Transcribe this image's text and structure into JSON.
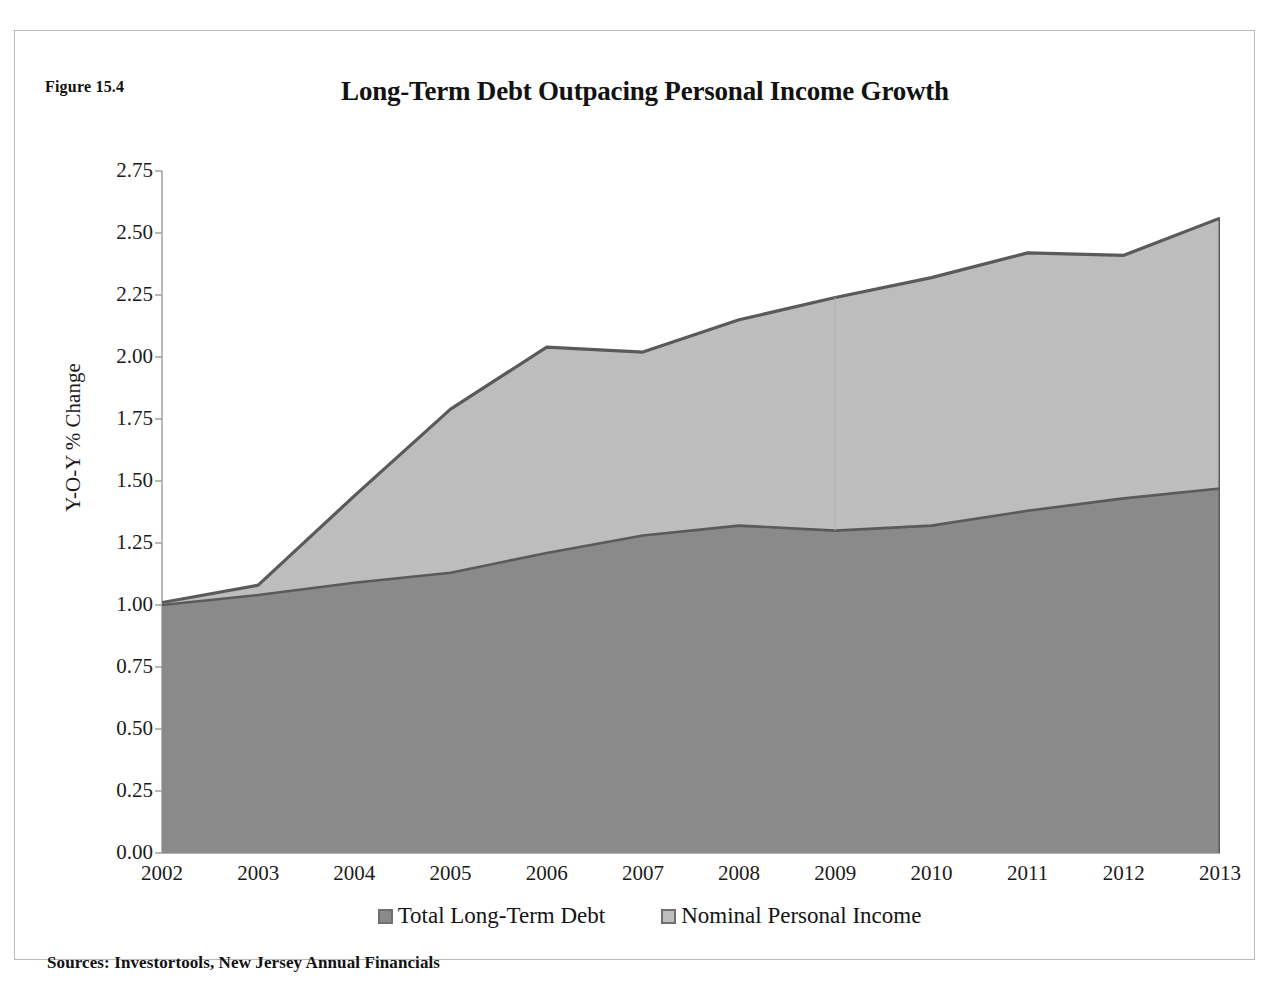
{
  "figure": {
    "number_label": "Figure 15.4",
    "source_note": "Sources: Investortools, New Jersey Annual Financials"
  },
  "chart_data": {
    "type": "area",
    "stacked": true,
    "title": "Long-Term Debt Outpacing Personal Income Growth",
    "xlabel": "",
    "ylabel": "Y-O-Y % Change",
    "categories": [
      "2002",
      "2003",
      "2004",
      "2005",
      "2006",
      "2007",
      "2008",
      "2009",
      "2010",
      "2011",
      "2012",
      "2013"
    ],
    "x": [
      2002,
      2003,
      2004,
      2005,
      2006,
      2007,
      2008,
      2009,
      2010,
      2011,
      2012,
      2013
    ],
    "series": [
      {
        "name": "Total Long-Term Debt",
        "color": "#8a8a8a",
        "values": [
          1.0,
          1.04,
          1.09,
          1.13,
          1.21,
          1.28,
          1.32,
          1.3,
          1.32,
          1.38,
          1.43,
          1.47
        ]
      },
      {
        "name": "Nominal Personal Income",
        "color": "#bdbdbd",
        "values": [
          0.01,
          0.04,
          0.35,
          0.66,
          0.83,
          0.74,
          0.83,
          0.94,
          1.0,
          1.04,
          0.98,
          1.09
        ]
      }
    ],
    "cumulative_top": [
      1.01,
      1.08,
      1.44,
      1.79,
      2.04,
      2.02,
      2.15,
      2.24,
      2.32,
      2.42,
      2.41,
      2.56
    ],
    "ylim": [
      0.0,
      2.75
    ],
    "ytick_values": [
      0.0,
      0.25,
      0.5,
      0.75,
      1.0,
      1.25,
      1.5,
      1.75,
      2.0,
      2.25,
      2.5,
      2.75
    ],
    "ytick_labels": [
      "0.00",
      "0.25",
      "0.50",
      "0.75",
      "1.00",
      "1.25",
      "1.50",
      "1.75",
      "2.00",
      "2.25",
      "2.50",
      "2.75"
    ],
    "grid": false,
    "legend_position": "bottom",
    "legend": [
      {
        "label": "Total Long-Term Debt",
        "swatch": "dark"
      },
      {
        "label": "Nominal Personal Income",
        "swatch": "light"
      }
    ],
    "line_color": "#5a5a5a",
    "axis_color": "#9a9a9a"
  }
}
